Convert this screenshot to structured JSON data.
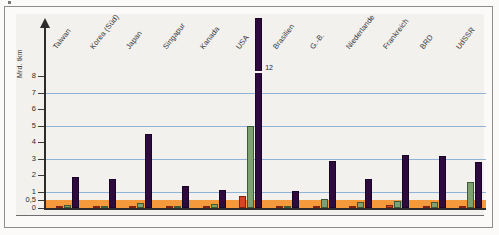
{
  "chart_data": {
    "type": "bar",
    "title": "",
    "subtitle": "",
    "xlabel": "",
    "ylabel": "Mrd. tkm",
    "ylim": [
      0,
      8.6
    ],
    "grid": true,
    "gridlines": [
      1,
      3,
      5,
      7
    ],
    "legend_position": "none",
    "y_ticks": [
      "0",
      "0,5",
      "1",
      "2",
      "3",
      "4",
      "5",
      "6",
      "7",
      "8"
    ],
    "y_tick_values": [
      0,
      0.5,
      1,
      2,
      3,
      4,
      5,
      6,
      7,
      8
    ],
    "highlight_band": {
      "from": 0,
      "to": 0.5,
      "color": "#f59a3c"
    },
    "categories": [
      "Taiwan",
      "Korea (Süd)",
      "Japan",
      "Singapur",
      "Kanada",
      "USA",
      "Brasilien",
      "G.-B.",
      "Niederlande",
      "Frankreich",
      "BRD",
      "UdSSR"
    ],
    "series": [
      {
        "name": "rot",
        "color": "#d6442a",
        "values": [
          0.05,
          0.06,
          0.08,
          0.06,
          0.05,
          0.72,
          0.05,
          0.06,
          0.05,
          0.18,
          0.05,
          0.12
        ]
      },
      {
        "name": "gruen",
        "color": "#7fa070",
        "values": [
          0.18,
          0.06,
          0.32,
          0.06,
          0.22,
          5.0,
          0.13,
          0.55,
          0.35,
          0.45,
          0.38,
          1.55
        ]
      },
      {
        "name": "lila",
        "color": "#2e0b3f",
        "values": [
          1.9,
          1.75,
          4.5,
          1.35,
          1.1,
          12.0,
          1.05,
          2.85,
          1.75,
          3.2,
          3.15,
          2.8
        ]
      }
    ],
    "annotations": [
      {
        "category": "USA",
        "series": "lila",
        "text": "12",
        "note": "bar clipped at axis top"
      }
    ]
  }
}
